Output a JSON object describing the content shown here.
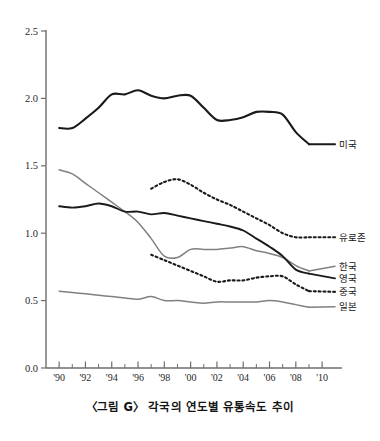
{
  "caption": "〈그림 G〉 각국의 연도별 유통속도 추이",
  "axis": {
    "y_ticks": [
      "2.5",
      "2.0",
      "1.5",
      "1.0",
      "0.5",
      "0.0"
    ],
    "x_ticks": [
      "'90",
      "'92",
      "'94",
      "'96",
      "'98",
      "'00",
      "'02",
      "'04",
      "'06",
      "'08",
      "'10"
    ]
  },
  "legend": {
    "usa": "미국",
    "eurozone": "유로존",
    "korea": "한국",
    "uk": "영국",
    "china": "중국",
    "japan": "일본"
  },
  "colors": {
    "black": "#1a1a1a",
    "gray": "#808080",
    "axis": "#6e6e6e",
    "background": "#ffffff"
  },
  "chart_data": {
    "type": "line",
    "title": "〈그림 G〉 각국의 연도별 유통속도 추이",
    "xlabel": "",
    "ylabel": "",
    "xlim": [
      1989,
      2010.6
    ],
    "ylim": [
      0.0,
      2.5
    ],
    "y_tick_values": [
      0.0,
      0.5,
      1.0,
      1.5,
      2.0,
      2.5
    ],
    "x_tick_values": [
      1990,
      1992,
      1994,
      1996,
      1998,
      2000,
      2002,
      2004,
      2006,
      2008,
      2010
    ],
    "x_minor_ticks": [
      1991,
      1993,
      1995,
      1997,
      1999,
      2001,
      2003,
      2005,
      2007,
      2009
    ],
    "grid": false,
    "legend_position": "right-inline",
    "series": [
      {
        "name": "미국",
        "style": "solid",
        "color": "#1a1a1a",
        "width": 2.1,
        "x": [
          1990,
          1991,
          1992,
          1993,
          1994,
          1995,
          1996,
          1997,
          1998,
          1999,
          2000,
          2001,
          2002,
          2003,
          2004,
          2005,
          2006,
          2007,
          2008,
          2009
        ],
        "values": [
          1.78,
          1.78,
          1.85,
          1.93,
          2.03,
          2.03,
          2.06,
          2.02,
          2.0,
          2.02,
          2.02,
          1.93,
          1.84,
          1.84,
          1.86,
          1.9,
          1.9,
          1.88,
          1.75,
          1.66
        ],
        "label_value": 1.66
      },
      {
        "name": "유로존",
        "style": "dotted",
        "color": "#1a1a1a",
        "width": 2.1,
        "x": [
          1997,
          1998,
          1999,
          2000,
          2001,
          2002,
          2003,
          2004,
          2005,
          2006,
          2007,
          2008,
          2009
        ],
        "values": [
          1.33,
          1.38,
          1.4,
          1.36,
          1.3,
          1.25,
          1.21,
          1.16,
          1.11,
          1.06,
          1.0,
          0.97,
          0.97
        ],
        "label_value": 0.97
      },
      {
        "name": "한국",
        "style": "solid",
        "color": "#808080",
        "width": 1.5,
        "x": [
          1990,
          1991,
          1992,
          1993,
          1994,
          1995,
          1996,
          1997,
          1998,
          1999,
          2000,
          2001,
          2002,
          2003,
          2004,
          2005,
          2006,
          2007,
          2008,
          2009
        ],
        "values": [
          1.47,
          1.44,
          1.37,
          1.3,
          1.23,
          1.16,
          1.08,
          0.96,
          0.83,
          0.82,
          0.88,
          0.88,
          0.88,
          0.89,
          0.9,
          0.87,
          0.85,
          0.82,
          0.76,
          0.72
        ],
        "label_value": 0.72
      },
      {
        "name": "영국",
        "style": "solid",
        "color": "#1a1a1a",
        "width": 1.9,
        "x": [
          1990,
          1991,
          1992,
          1993,
          1994,
          1995,
          1996,
          1997,
          1998,
          1999,
          2000,
          2001,
          2002,
          2003,
          2004,
          2005,
          2006,
          2007,
          2008,
          2009
        ],
        "values": [
          1.2,
          1.19,
          1.2,
          1.22,
          1.2,
          1.16,
          1.16,
          1.14,
          1.15,
          1.13,
          1.11,
          1.09,
          1.07,
          1.05,
          1.02,
          0.96,
          0.9,
          0.83,
          0.73,
          0.7
        ],
        "label_value": 0.7
      },
      {
        "name": "중국",
        "style": "dotted",
        "color": "#1a1a1a",
        "width": 2.1,
        "x": [
          1997,
          1998,
          1999,
          2000,
          2001,
          2002,
          2003,
          2004,
          2005,
          2006,
          2007,
          2008,
          2009
        ],
        "values": [
          0.84,
          0.8,
          0.76,
          0.72,
          0.68,
          0.64,
          0.65,
          0.65,
          0.67,
          0.68,
          0.68,
          0.62,
          0.57
        ],
        "label_value": 0.57
      },
      {
        "name": "일본",
        "style": "solid",
        "color": "#808080",
        "width": 1.5,
        "x": [
          1990,
          1991,
          1992,
          1993,
          1994,
          1995,
          1996,
          1997,
          1998,
          1999,
          2000,
          2001,
          2002,
          2003,
          2004,
          2005,
          2006,
          2007,
          2008,
          2009
        ],
        "values": [
          0.57,
          0.56,
          0.55,
          0.54,
          0.53,
          0.52,
          0.51,
          0.53,
          0.5,
          0.5,
          0.49,
          0.48,
          0.49,
          0.49,
          0.49,
          0.49,
          0.5,
          0.49,
          0.47,
          0.45
        ],
        "label_value": 0.45
      }
    ]
  }
}
